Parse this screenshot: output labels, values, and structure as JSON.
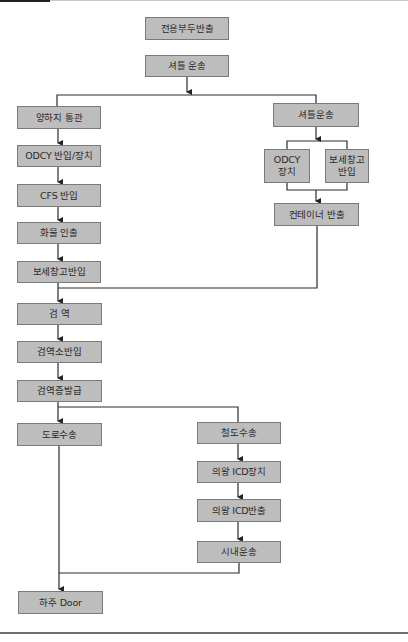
{
  "diagram": {
    "type": "flowchart",
    "nodes": {
      "n1": "전용부두반출",
      "n2": "셔틀 운송",
      "l1": "양하지 통관",
      "l2": "ODCY 반입/장치",
      "l3": "CFS 반입",
      "l4": "화물 인출",
      "l5": "보세창고반입",
      "r1": "셔틀운송",
      "r2a": "ODCY\n장치",
      "r2b": "보세창고\n반입",
      "r3": "컨테이너 반출",
      "c1": "검 역",
      "c2": "검역소반입",
      "c3": "검역증발급",
      "d1": "도로수송",
      "t1": "철도수송",
      "t2": "의왕 ICD장치",
      "t3": "의왕 ICD반출",
      "t4": "시내운송",
      "end": "하주 Door"
    },
    "edges": [
      [
        "전용부두반출",
        "셔틀 운송"
      ],
      [
        "셔틀 운송",
        "양하지 통관"
      ],
      [
        "셔틀 운송",
        "셔틀운송"
      ],
      [
        "양하지 통관",
        "ODCY 반입/장치"
      ],
      [
        "ODCY 반입/장치",
        "CFS 반입"
      ],
      [
        "CFS 반입",
        "화물 인출"
      ],
      [
        "화물 인출",
        "보세창고반입"
      ],
      [
        "셔틀운송",
        "ODCY 장치"
      ],
      [
        "셔틀운송",
        "보세창고 반입"
      ],
      [
        "ODCY 장치",
        "컨테이너 반출"
      ],
      [
        "보세창고 반입",
        "컨테이너 반출"
      ],
      [
        "보세창고반입",
        "검 역"
      ],
      [
        "컨테이너 반출",
        "검 역"
      ],
      [
        "검 역",
        "검역소반입"
      ],
      [
        "검역소반입",
        "검역증발급"
      ],
      [
        "검역증발급",
        "도로수송"
      ],
      [
        "검역증발급",
        "철도수송"
      ],
      [
        "철도수송",
        "의왕 ICD장치"
      ],
      [
        "의왕 ICD장치",
        "의왕 ICD반출"
      ],
      [
        "의왕 ICD반출",
        "시내운송"
      ],
      [
        "도로수송",
        "하주 Door"
      ],
      [
        "시내운송",
        "하주 Door"
      ]
    ],
    "colors": {
      "box_fill": "#bdbdbd",
      "box_border": "#7a7a7a",
      "line": "#2b2b2b"
    }
  }
}
